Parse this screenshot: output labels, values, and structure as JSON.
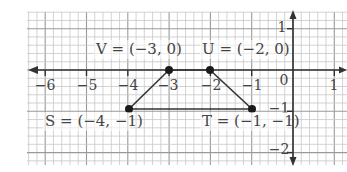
{
  "figure": {
    "type": "coordinate-plane",
    "x_range": [
      -6,
      1
    ],
    "y_range": [
      -2,
      1
    ],
    "x_tick_labels": [
      "−6",
      "−5",
      "−4",
      "−3",
      "−2",
      "−1",
      "0",
      "1"
    ],
    "y_tick_labels": [
      "1",
      "−1",
      "−2"
    ],
    "origin_label": "0",
    "points": [
      {
        "name": "V",
        "x": -3,
        "y": 0,
        "label": "V = (−3, 0)"
      },
      {
        "name": "U",
        "x": -2,
        "y": 0,
        "label": "U = (−2, 0)"
      },
      {
        "name": "T",
        "x": -1,
        "y": -1,
        "label": "T = (−1, −1)"
      },
      {
        "name": "S",
        "x": -4,
        "y": -1,
        "label": "S = (−4, −1)"
      }
    ],
    "polygon": [
      "V",
      "U",
      "T",
      "S"
    ],
    "colors": {
      "grid_minor": "#c8c8c8",
      "grid_major": "#9a9a9a",
      "axis": "#333333",
      "shape": "#333333",
      "point": "#1a1a1a",
      "text": "#444444"
    }
  }
}
